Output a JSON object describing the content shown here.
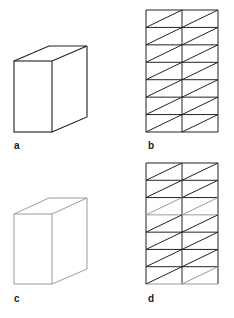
{
  "figure": {
    "colors": {
      "dark": "#222222",
      "gray": "#9a9a9a",
      "light_gray": "#b0b0b0",
      "background": "#ffffff"
    },
    "panels": [
      {
        "id": "a",
        "label": "a",
        "type": "cube-outline",
        "stroke": "dark",
        "label_pos": [
          14,
          141
        ]
      },
      {
        "id": "b",
        "label": "b",
        "type": "triangulated-grid",
        "rows": 7,
        "cols": 2,
        "stroke": "dark",
        "label_pos": [
          148,
          141
        ]
      },
      {
        "id": "c",
        "label": "c",
        "type": "cube-outline",
        "stroke": "light_gray",
        "label_pos": [
          14,
          294
        ]
      },
      {
        "id": "d",
        "label": "d",
        "type": "triangulated-grid",
        "rows": 7,
        "cols": 2,
        "stroke": "mixed",
        "gray_diagonals": [
          [
            2,
            0
          ],
          [
            2,
            1
          ],
          [
            6,
            1
          ]
        ],
        "label_pos": [
          148,
          294
        ]
      }
    ]
  }
}
